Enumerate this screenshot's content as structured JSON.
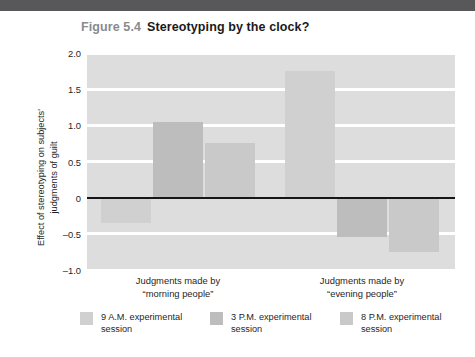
{
  "figure": {
    "number": "Figure 5.4",
    "title": "Stereotyping by the clock?"
  },
  "colors": {
    "top_rule": "#58585a",
    "plot_background": "#dddddd",
    "gridline": "#ffffff",
    "zero_line": "#161616",
    "series_9am": "#d0d0d0",
    "series_3pm": "#bdbdbd",
    "series_8pm": "#c9c9c9",
    "figure_number_text": "#8a8a8c",
    "title_text": "#1a1a1a"
  },
  "chart_data": {
    "type": "bar",
    "title": "Stereotyping by the clock?",
    "xlabel": "",
    "ylabel": "Effect of stereotyping on subjects' judgments of guilt",
    "ylabel_lines": [
      "Effect of stereotyping on subjects'",
      "judgments of guilt"
    ],
    "ylim": [
      -1.0,
      2.0
    ],
    "yticks": [
      2.0,
      1.5,
      1.0,
      0.5,
      0,
      -0.5,
      -1.0
    ],
    "ytick_labels": [
      "2.0",
      "1.5",
      "1.0",
      "0.5",
      "0",
      "–0.5",
      "–1.0"
    ],
    "grid": true,
    "grid_axis": "y",
    "zero_line": 0,
    "legend_position": "below",
    "categories": [
      "Judgments made by “morning people”",
      "Judgments made by “evening people”"
    ],
    "category_lines": [
      [
        "Judgments made by",
        "“morning people”"
      ],
      [
        "Judgments made by",
        "“evening people”"
      ]
    ],
    "series": [
      {
        "name": "9 A.M. experimental session",
        "values": [
          -0.35,
          1.75
        ]
      },
      {
        "name": "3 P.M. experimental session",
        "values": [
          1.05,
          -0.55
        ]
      },
      {
        "name": "8 P.M. experimental session",
        "values": [
          0.75,
          -0.75
        ]
      }
    ]
  },
  "legend": {
    "items": [
      {
        "label_lines": [
          "9 A.M. experimental",
          "session"
        ],
        "label": "9 A.M. experimental session"
      },
      {
        "label_lines": [
          "3 P.M. experimental",
          "session"
        ],
        "label": "3 P.M. experimental session"
      },
      {
        "label_lines": [
          "8 P.M. experimental",
          "session"
        ],
        "label": "8 P.M. experimental session"
      }
    ]
  },
  "y_ticks": [
    {
      "label": "2.0"
    },
    {
      "label": "1.5"
    },
    {
      "label": "1.0"
    },
    {
      "label": "0.5"
    },
    {
      "label": "0"
    },
    {
      "label": "–0.5"
    },
    {
      "label": "–1.0"
    }
  ],
  "x_categories": [
    {
      "line1": "Judgments made by",
      "line2": "“morning people”"
    },
    {
      "line1": "Judgments made by",
      "line2": "“evening people”"
    }
  ]
}
